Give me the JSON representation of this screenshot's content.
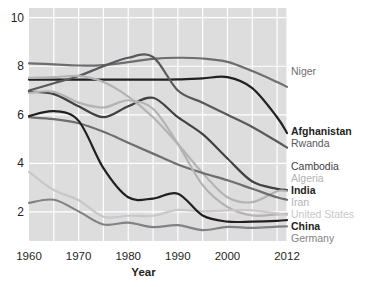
{
  "chart_data": {
    "type": "line",
    "title": "",
    "xlabel": "Year",
    "ylabel": "",
    "xlim": [
      1960,
      2012
    ],
    "ylim": [
      0.8,
      10.4
    ],
    "grid": true,
    "grid_color": "#ffffff",
    "plot_background": "#dddddd",
    "legend_position": "right",
    "xticks": [
      1960,
      1970,
      1980,
      1990,
      2000,
      2012
    ],
    "xtick_labels": [
      "1960",
      "1970",
      "1980",
      "1990",
      "2000",
      "2012"
    ],
    "yticks": [
      2,
      4,
      6,
      8,
      10
    ],
    "ytick_labels": [
      "2",
      "4",
      "6",
      "8",
      "10"
    ],
    "minor_gridlines_x": [
      1965,
      1975,
      1985,
      1995,
      2005,
      2010
    ],
    "x": [
      1960,
      1965,
      1970,
      1975,
      1980,
      1985,
      1990,
      1995,
      2000,
      2005,
      2010,
      2012
    ],
    "series": [
      {
        "name": "Niger",
        "label": "Niger",
        "color": "#6d6e70",
        "bold": false,
        "label_y": 66,
        "values": [
          8.12,
          8.08,
          8.03,
          8.05,
          8.17,
          8.3,
          8.35,
          8.32,
          8.18,
          7.8,
          7.35,
          7.15
        ]
      },
      {
        "name": "Afghanistan",
        "label": "Afghanistan",
        "color": "#231f20",
        "bold": true,
        "label_y": 126,
        "values": [
          7.45,
          7.45,
          7.45,
          7.45,
          7.45,
          7.45,
          7.46,
          7.5,
          7.55,
          7.1,
          5.9,
          5.25
        ]
      },
      {
        "name": "Rwanda",
        "label": "Rwanda",
        "color": "#58595b",
        "bold": false,
        "label_y": 138,
        "values": [
          7.0,
          7.3,
          7.6,
          8.0,
          8.35,
          8.38,
          7.0,
          6.5,
          6.0,
          5.5,
          4.9,
          4.65
        ]
      },
      {
        "name": "Cambodia",
        "label": "Cambodia",
        "color": "#414042",
        "bold": false,
        "label_y": 161,
        "values": [
          6.95,
          6.85,
          6.35,
          5.9,
          6.35,
          6.7,
          5.9,
          5.2,
          4.2,
          3.25,
          2.95,
          2.9
        ]
      },
      {
        "name": "Algeria",
        "label": "Algeria",
        "color": "#b3b3b3",
        "bold": false,
        "label_y": 173,
        "values": [
          7.52,
          7.55,
          7.6,
          7.35,
          6.75,
          5.9,
          4.8,
          3.6,
          2.6,
          2.4,
          2.85,
          2.85
        ]
      },
      {
        "name": "India",
        "label": "India",
        "color": "#6d6e70",
        "bold": true,
        "label_y": 185,
        "values": [
          5.9,
          5.82,
          5.65,
          5.3,
          4.85,
          4.4,
          3.95,
          3.6,
          3.3,
          2.95,
          2.6,
          2.5
        ]
      },
      {
        "name": "Iran",
        "label": "Iran",
        "color": "#b3b3b3",
        "bold": false,
        "label_y": 197,
        "values": [
          6.9,
          6.95,
          6.5,
          6.3,
          6.6,
          6.25,
          4.8,
          3.1,
          2.2,
          1.85,
          1.9,
          1.92
        ]
      },
      {
        "name": "United States",
        "label": "United States",
        "color": "#c7c8ca",
        "bold": false,
        "label_y": 209,
        "values": [
          3.65,
          2.9,
          2.48,
          1.8,
          1.84,
          1.84,
          2.08,
          2.02,
          2.06,
          2.06,
          1.93,
          1.88
        ]
      },
      {
        "name": "China",
        "label": "China",
        "color": "#231f20",
        "bold": true,
        "label_y": 221,
        "values": [
          5.95,
          6.15,
          5.75,
          3.8,
          2.6,
          2.55,
          2.75,
          1.85,
          1.6,
          1.6,
          1.63,
          1.66
        ]
      },
      {
        "name": "Germany",
        "label": "Germany",
        "color": "#808285",
        "bold": false,
        "label_y": 233,
        "values": [
          2.37,
          2.5,
          2.02,
          1.48,
          1.56,
          1.37,
          1.45,
          1.25,
          1.38,
          1.34,
          1.39,
          1.4
        ]
      }
    ]
  }
}
